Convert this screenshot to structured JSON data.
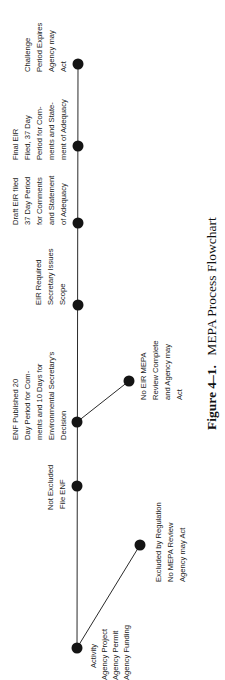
{
  "figure": {
    "caption_number": "Figure 4–1.",
    "caption_title": "MEPA Process Flowchart",
    "orientation": "rotated 90° counter-clockwise (text reads bottom-to-top)"
  },
  "colors": {
    "line": "#2a2a2a",
    "node": "#141414",
    "text": "#1a1a1a",
    "background": "#ffffff"
  },
  "nodes": [
    {
      "id": "activity",
      "lines": [
        "Activity",
        "Agency Project",
        "Agency Permit",
        "Agency Funding"
      ]
    },
    {
      "id": "excluded",
      "lines": [
        "Excluded by Regulation",
        "No MEPA Review",
        "Agency may Act"
      ]
    },
    {
      "id": "not_excluded",
      "lines": [
        "Not Excluded",
        "File ENF"
      ]
    },
    {
      "id": "enf",
      "lines": [
        "ENF Published 20",
        "Day Period for Com-",
        "ments and 10 Days for",
        "Environmental Secretary's",
        "Decision"
      ]
    },
    {
      "id": "no_eir",
      "lines": [
        "No EIR MEPA",
        "Review Complete",
        "and Agency may",
        "Act"
      ]
    },
    {
      "id": "eir_required",
      "lines": [
        "EIR Required",
        "Secretary Issues",
        "Scope"
      ]
    },
    {
      "id": "draft_eir",
      "lines": [
        "Draft EIR filed",
        "37 Day Period",
        "for Comments",
        "and Statement",
        "of Adequacy"
      ]
    },
    {
      "id": "final_eir",
      "lines": [
        "Final EIR",
        "Filed, 37 Day",
        "Period for Com-",
        "ments and State-",
        "ment of Adequacy"
      ]
    },
    {
      "id": "challenge",
      "lines": [
        "Challenge",
        "Period Expires",
        "Agency may",
        "Act"
      ]
    }
  ],
  "edges": [
    [
      "activity",
      "not_excluded"
    ],
    [
      "activity",
      "excluded"
    ],
    [
      "not_excluded",
      "enf"
    ],
    [
      "enf",
      "no_eir"
    ],
    [
      "enf",
      "eir_required"
    ],
    [
      "eir_required",
      "draft_eir"
    ],
    [
      "draft_eir",
      "final_eir"
    ],
    [
      "final_eir",
      "challenge"
    ]
  ]
}
